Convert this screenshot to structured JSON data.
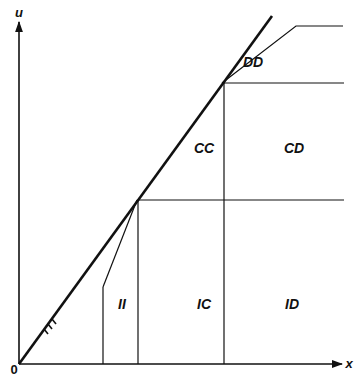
{
  "axes": {
    "x_label": "x",
    "y_label": "u",
    "origin_label": "0"
  },
  "regions": {
    "DD": "DD",
    "CC": "CC",
    "CD": "CD",
    "II": "II",
    "IC": "IC",
    "ID": "ID"
  },
  "diagonal_mark": "///",
  "colors": {
    "line": "#111111",
    "background": "#ffffff"
  }
}
